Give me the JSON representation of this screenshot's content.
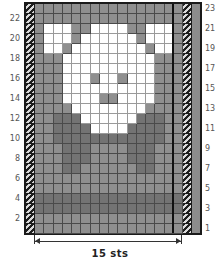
{
  "chart": {
    "width_label": "15 sts",
    "columns": 16,
    "rows": 23,
    "shade_colors": {
      "W": "#ffffff",
      "L": "#8f8f8f",
      "D": "#737373"
    },
    "left_row_labels": [
      "22",
      "20",
      "18",
      "16",
      "14",
      "12",
      "10",
      "8",
      "6",
      "4",
      "2"
    ],
    "right_row_labels": [
      "23",
      "21",
      "19",
      "17",
      "15",
      "13",
      "11",
      "9",
      "7",
      "5",
      "3",
      "1"
    ],
    "grid_top_to_bottom": [
      "LLLLLLLLLLLLLLLL",
      "LLLLLLLLLLLLLLLL",
      "LWWWLLWWWWLLWWWL",
      "LWWWLWWWWWWLWWWL",
      "LWWLWWWWWWWWLWWL",
      "LLLWWWWWWWWWWLLL",
      "LLLWWWWWWWWWWLLL",
      "LLLWWWLWWLWWWLLL",
      "LLLWWWWWWWWWWLLL",
      "LLLWWWWLLWWWWLLL",
      "LLLLWWWWWWWWLLLL",
      "LLDDDWWWWWWDDDLL",
      "LLDDDDWWWWDDDDLL",
      "LLDDDDDDDDDDDDLL",
      "LLLDDDLLLLDDDLLL",
      "LLLDDDLLLLDDDLLL",
      "LLLDDLLLLLLDDLLL",
      "LLLLLLLLLLLLLLLL",
      "LLLLLLLLLLLLLLLL",
      "DDDDDDDDDDDDDDDD",
      "DDDDDDDDDDDDDDDD",
      "LLLLLLLLLLLLLLLL",
      "LLLLLLLLLLLLLLLL"
    ]
  }
}
